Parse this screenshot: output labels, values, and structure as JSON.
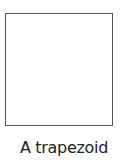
{
  "figure": {
    "shape": "square",
    "caption": "A trapezoid",
    "stroke_color": "#555555"
  }
}
